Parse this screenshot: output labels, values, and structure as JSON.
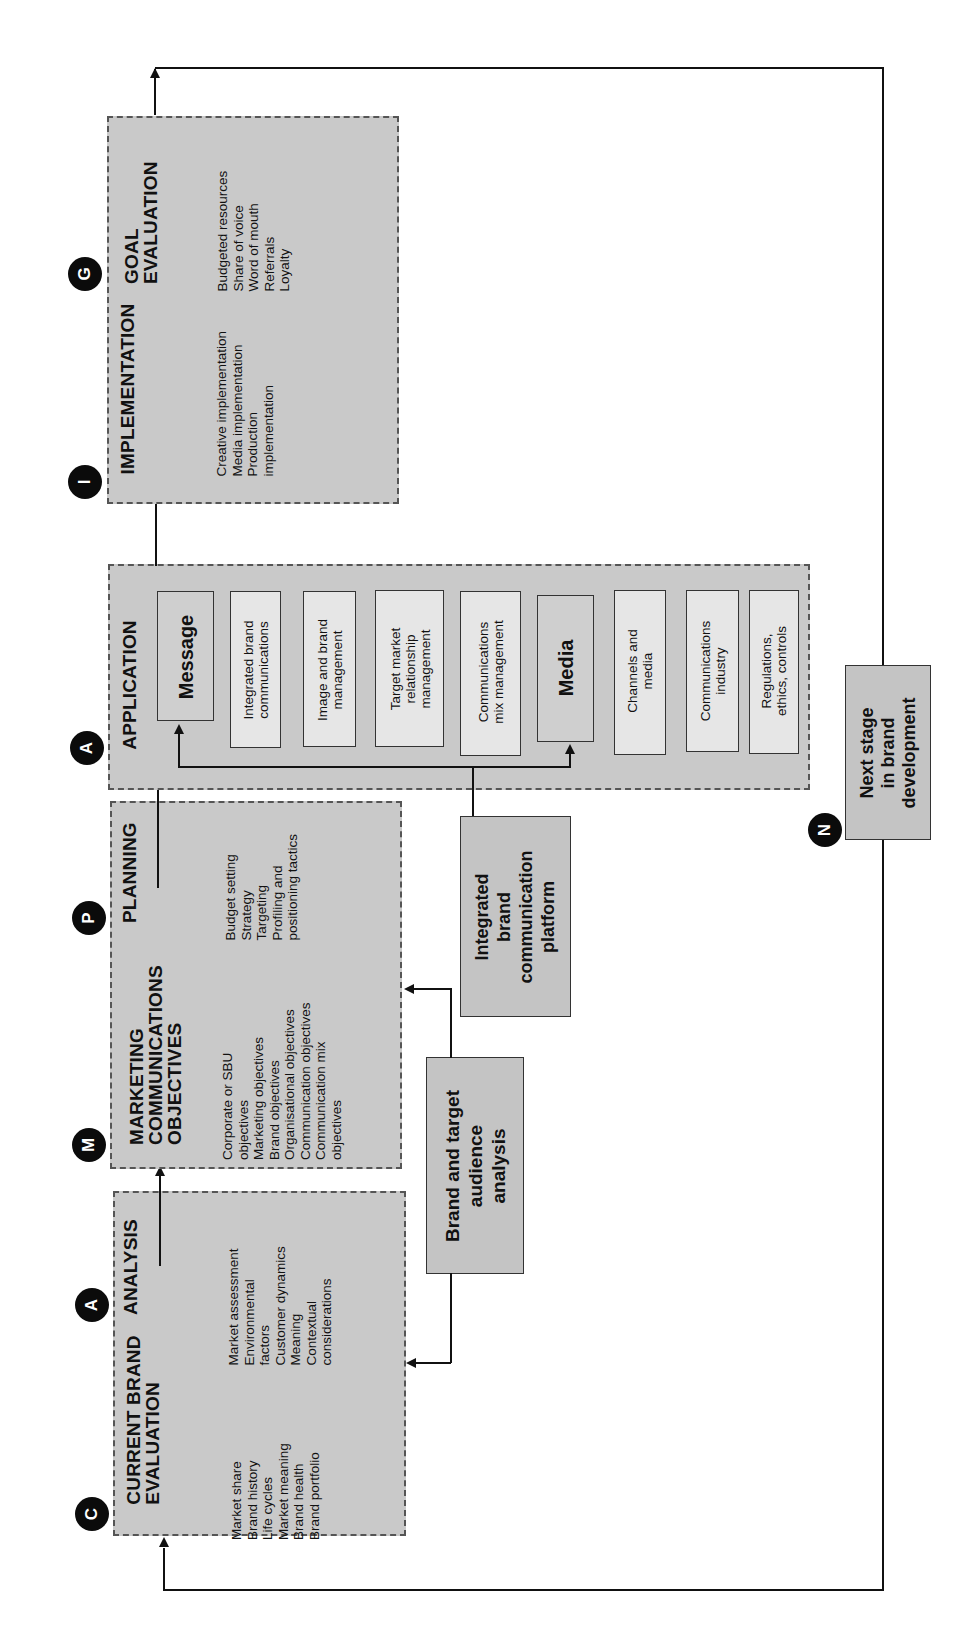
{
  "diagram": {
    "orientation": "rotated 90° counter-clockwise",
    "stages": [
      {
        "id": "current-brand-evaluation",
        "marker": "C",
        "heading": [
          "CURRENT BRAND",
          "EVALUATION"
        ],
        "items": [
          "Market share",
          "Brand history",
          "Life cycles",
          "Market meaning",
          "Brand health",
          "Brand portfolio"
        ]
      },
      {
        "id": "analysis",
        "marker": "A",
        "heading": [
          "ANALYSIS"
        ],
        "items": [
          "Market assessment",
          "Environmental",
          "factors",
          "Customer dynamics",
          "Meaning",
          "Contextual",
          "considerations"
        ]
      },
      {
        "id": "marketing-communications-objectives",
        "marker": "M",
        "heading": [
          "MARKETING",
          "COMMUNICATIONS",
          "OBJECTIVES"
        ],
        "items": [
          "Corporate or SBU",
          "objectives",
          "Marketing objectives",
          "Brand objectives",
          "Organisational objectives",
          "Communication objectives",
          "Communication mix",
          "objectives"
        ]
      },
      {
        "id": "planning",
        "marker": "P",
        "heading": [
          "PLANNING"
        ],
        "items": [
          "Budget setting",
          "Strategy",
          "Targeting",
          "Profiling and",
          "positioning tactics"
        ]
      },
      {
        "id": "application",
        "marker": "A",
        "heading": [
          "APPLICATION"
        ],
        "boxes": [
          {
            "label": "Message",
            "style": "bold"
          },
          {
            "label": [
              "Integrated brand",
              "communications"
            ],
            "style": "light"
          },
          {
            "label": [
              "Image and brand",
              "management"
            ],
            "style": "light"
          },
          {
            "label": [
              "Target market",
              "relationship",
              "management"
            ],
            "style": "light"
          },
          {
            "label": [
              "Communications",
              "mix management"
            ],
            "style": "light"
          },
          {
            "label": "Media",
            "style": "bold"
          },
          {
            "label": [
              "Channels and",
              "media"
            ],
            "style": "light"
          },
          {
            "label": [
              "Communications",
              "industry"
            ],
            "style": "light"
          },
          {
            "label": [
              "Regulations,",
              "ethics, controls"
            ],
            "style": "light"
          }
        ]
      },
      {
        "id": "implementation",
        "marker": "I",
        "heading": [
          "IMPLEMENTATION"
        ],
        "items": [
          "Creative implementation",
          "Media implementation",
          "Production",
          "implementation"
        ]
      },
      {
        "id": "goal-evaluation",
        "marker": "G",
        "heading": [
          "GOAL",
          "EVALUATION"
        ],
        "items": [
          "Budgeted resources",
          "Share of voice",
          "Word of mouth",
          "Referrals",
          "Loyalty"
        ]
      }
    ],
    "side_boxes": {
      "brand_target": [
        "Brand and target",
        "audience",
        "analysis"
      ],
      "ibcp": [
        "Integrated",
        "brand",
        "communication",
        "platform"
      ],
      "next_stage": {
        "marker": "N",
        "label": [
          "Next stage",
          "in brand",
          "development"
        ]
      }
    },
    "colors": {
      "stage_fill": "#c9c9c9",
      "inner_light": "#e6e6e6",
      "inner_bold": "#cfcfcf",
      "marker": "#0b0b0b",
      "line": "#111111"
    }
  }
}
